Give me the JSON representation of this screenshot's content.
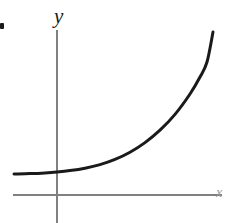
{
  "figure": {
    "name": "exponential-growth-curve",
    "background_color": "#ffffff",
    "width": 227,
    "height": 223,
    "bullet_marker": "•"
  },
  "labels": {
    "y_axis": "y",
    "x_axis": "x"
  },
  "colors": {
    "curve": "#1a1a1a",
    "axis": "#808080",
    "x_label": "#9a9a9a",
    "y_label": "#1a1a1a",
    "background": "#ffffff"
  },
  "chart_data": {
    "type": "line",
    "title": "",
    "subtitle": "",
    "xlabel": "x",
    "ylabel": "y",
    "grid": false,
    "legend": null,
    "axes": {
      "x_axis_pixel_y": 195,
      "y_axis_pixel_x": 57,
      "x_axis_start_px": 13,
      "x_axis_end_px": 222,
      "y_axis_start_px": 30,
      "y_axis_end_px": 223,
      "origin_px": [
        57,
        195
      ],
      "x_arrow": false,
      "y_arrow": false
    },
    "series": [
      {
        "name": "y = exponential(x)",
        "stroke_width": 3,
        "color": "#1a1a1a",
        "points_px": [
          [
            14,
            174
          ],
          [
            30,
            173.6
          ],
          [
            45,
            172.9
          ],
          [
            57,
            172.0
          ],
          [
            70,
            170.6
          ],
          [
            85,
            168.2
          ],
          [
            100,
            164.6
          ],
          [
            115,
            159.4
          ],
          [
            130,
            152.2
          ],
          [
            145,
            142.6
          ],
          [
            160,
            130.2
          ],
          [
            175,
            114.4
          ],
          [
            190,
            94.0
          ],
          [
            200,
            77.0
          ],
          [
            207,
            62.0
          ],
          [
            213,
            32.0
          ]
        ]
      }
    ],
    "xlim_px": [
      13,
      222
    ],
    "ylim_px": [
      30,
      195
    ]
  }
}
